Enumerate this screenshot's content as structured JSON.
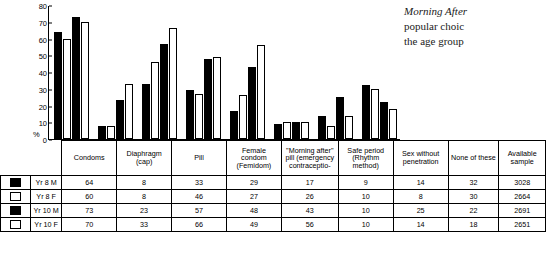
{
  "note": {
    "line1": "Morning After",
    "line2": "popular choic",
    "line3": "the age group"
  },
  "chart_data": {
    "type": "bar",
    "title": "",
    "xlabel": "",
    "ylabel": "%",
    "ylim": [
      0,
      80
    ],
    "yticks": [
      0,
      10,
      20,
      30,
      40,
      50,
      60,
      70,
      80
    ],
    "grid": false,
    "legend_position": "table-left",
    "categories": [
      "Condoms",
      "Diaphragm (cap)",
      "Pill",
      "Female condom (Femidom)",
      "\"Morning after\" pill (emergency contraceptio-",
      "Safe period (Rhythm method)",
      "Sex without penetration",
      "None of these"
    ],
    "series": [
      {
        "name": "Yr 8 M",
        "swatch": "filled",
        "values": [
          64,
          8,
          33,
          29,
          17,
          9,
          14,
          32
        ],
        "sample": 3028
      },
      {
        "name": "Yr 8 F",
        "swatch": "open",
        "values": [
          60,
          8,
          46,
          27,
          26,
          10,
          8,
          30
        ],
        "sample": 2664
      },
      {
        "name": "Yr 10 M",
        "swatch": "filled",
        "values": [
          73,
          23,
          57,
          48,
          43,
          10,
          25,
          22
        ],
        "sample": 2691
      },
      {
        "name": "Yr 10 F",
        "swatch": "open",
        "values": [
          70,
          33,
          66,
          49,
          56,
          10,
          14,
          18
        ],
        "sample": 2651
      }
    ],
    "table": {
      "col_headers": [
        "Condoms",
        "Diaphragm (cap)",
        "Pill",
        "Female condom (Femidom)",
        "\"Morning after\" pill (emergency contraceptio-",
        "Safe period (Rhythm method)",
        "Sex without penetration",
        "None of these",
        "Available sample"
      ],
      "rows": [
        {
          "label": "Yr 8 M",
          "swatch": "filled",
          "cells": [
            "64",
            "8",
            "33",
            "29",
            "17",
            "9",
            "14",
            "32",
            "3028"
          ]
        },
        {
          "label": "Yr 8 F",
          "swatch": "open",
          "cells": [
            "60",
            "8",
            "46",
            "27",
            "26",
            "10",
            "8",
            "30",
            "2664"
          ]
        },
        {
          "label": "Yr 10 M",
          "swatch": "filled",
          "cells": [
            "73",
            "23",
            "57",
            "48",
            "43",
            "10",
            "25",
            "22",
            "2691"
          ]
        },
        {
          "label": "Yr 10 F",
          "swatch": "open",
          "cells": [
            "70",
            "33",
            "66",
            "49",
            "56",
            "10",
            "14",
            "18",
            "2651"
          ]
        }
      ]
    }
  }
}
